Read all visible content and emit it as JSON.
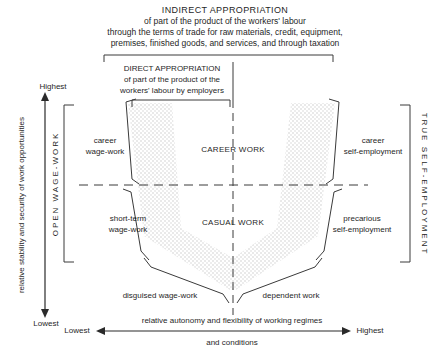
{
  "header": {
    "indirect_lines": [
      "INDIRECT APPROPRIATION",
      "of part of the product of the workers' labour",
      "through the terms of trade for raw materials, credit, equipment,",
      "premises, finished goods, and services, and through taxation"
    ],
    "direct_lines": [
      "DIRECT APPROPRIATION",
      "of part of the product of the",
      "workers' labour by employers"
    ]
  },
  "axes": {
    "vertical_label": "relative stability and security of work opportunities",
    "vertical_top": "Highest",
    "vertical_bottom": "Lowest",
    "horizontal_label_line1": "relative autonomy and flexibility of working regimes",
    "horizontal_label_line2": "and conditions",
    "horizontal_left": "Lowest",
    "horizontal_right": "Highest"
  },
  "sides": {
    "left_bracket_label": "OPEN WAGE-WORK",
    "right_bracket_label": "TRUE SELF-EMPLOYMENT"
  },
  "quadrants": {
    "top_center": "CAREER WORK",
    "bottom_center": "CASUAL WORK",
    "top_left": [
      "career",
      "wage-work"
    ],
    "bottom_left": [
      "short-term",
      "wage-work"
    ],
    "top_right": [
      "career",
      "self-employment"
    ],
    "bottom_right": [
      "precarious",
      "self-employment"
    ],
    "bottom_outer_left": "disguised wage-work",
    "bottom_outer_right": "dependent work"
  },
  "icons": {
    "up_down_arrow": "vertical-axis-arrow",
    "left_right_arrow": "horizontal-axis-arrow"
  },
  "colors": {
    "ink": "#2a2a2a",
    "stipple_dot": "#c3c3c3",
    "background": "#ffffff"
  }
}
